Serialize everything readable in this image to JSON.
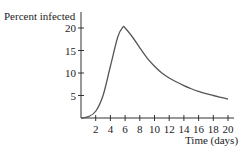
{
  "chart_data": {
    "type": "line",
    "title": "",
    "xlabel": "Time (days)",
    "ylabel": "Percent infected",
    "xlim": [
      0,
      20
    ],
    "ylim": [
      0,
      22
    ],
    "xticks": [
      2,
      4,
      6,
      8,
      10,
      12,
      14,
      16,
      18,
      20
    ],
    "yticks": [
      5,
      10,
      15,
      20
    ],
    "grid": false,
    "legend": null,
    "series": [
      {
        "name": "Percent infected",
        "x": [
          0,
          1,
          2,
          3,
          4,
          5,
          5.7,
          6,
          7,
          8,
          9,
          10,
          11,
          12,
          13,
          14,
          15,
          16,
          17,
          18,
          19,
          20
        ],
        "y": [
          0,
          0.3,
          1.5,
          5.0,
          11.5,
          18.0,
          20.2,
          20.0,
          18.0,
          15.6,
          13.3,
          11.5,
          10.0,
          8.9,
          8.0,
          7.2,
          6.5,
          5.9,
          5.4,
          5.0,
          4.6,
          4.2
        ]
      }
    ]
  },
  "axes": {
    "ylabel": "Percent infected",
    "xlabel": "Time (days)",
    "yticks": [
      "5",
      "10",
      "15",
      "20"
    ],
    "xticks": [
      "2",
      "4",
      "6",
      "8",
      "10",
      "12",
      "14",
      "16",
      "18",
      "20"
    ]
  },
  "colors": {
    "axis": "#333333",
    "line": "#555555",
    "text": "#222222"
  }
}
